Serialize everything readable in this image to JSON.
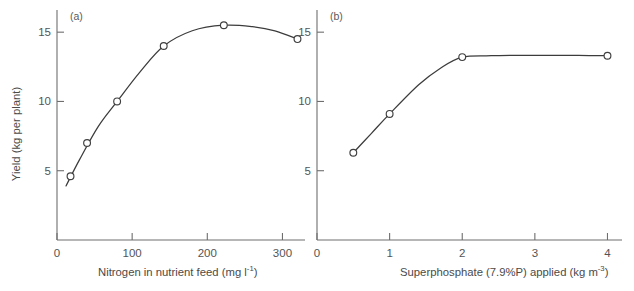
{
  "figure": {
    "ylabel": "Yield (kg per plant)",
    "caption_partial": ""
  },
  "chart_data": [
    {
      "type": "scatter",
      "panel_label": "(a)",
      "title": "",
      "xlabel": "Nitrogen in nutrient feed (mg l",
      "xlabel_sup": "-1",
      "xlabel_tail": ")",
      "ylabel": "Yield (kg per plant)",
      "xlim": [
        0,
        330
      ],
      "ylim": [
        0,
        16.6
      ],
      "xticks": [
        0,
        100,
        200,
        300
      ],
      "xticklabels": [
        "0",
        "100",
        "200",
        "300"
      ],
      "yticks": [
        5,
        10,
        15
      ],
      "yticklabels": [
        "5",
        "10",
        "15"
      ],
      "grid": false,
      "legend": "none",
      "marker": "open-circle",
      "x": [
        18,
        40,
        80,
        142,
        222,
        320
      ],
      "y": [
        4.6,
        7.0,
        10.0,
        14.0,
        15.5,
        14.5
      ],
      "fit_curve": {
        "description": "smooth fitted curve rising to a maximum near 230 mg/l then declining",
        "x": [
          12,
          30,
          55,
          80,
          110,
          142,
          180,
          222,
          260,
          290,
          320
        ],
        "y": [
          3.9,
          5.8,
          8.2,
          10.0,
          12.1,
          14.0,
          15.1,
          15.5,
          15.4,
          15.1,
          14.5
        ]
      }
    },
    {
      "type": "scatter",
      "panel_label": "(b)",
      "title": "",
      "xlabel": "Superphosphate (7.9%P) applied (kg m",
      "xlabel_sup": "-3",
      "xlabel_tail": ")",
      "ylabel": "Yield (kg per plant)",
      "xlim": [
        0,
        4.2
      ],
      "ylim": [
        0,
        16.6
      ],
      "xticks": [
        0,
        1,
        2,
        3,
        4
      ],
      "xticklabels": [
        "0",
        "1",
        "2",
        "3",
        "4"
      ],
      "yticks": [
        5,
        10,
        15
      ],
      "yticklabels": [
        "5",
        "10",
        "15"
      ],
      "grid": false,
      "legend": "none",
      "marker": "open-circle",
      "x": [
        0.5,
        1.0,
        2.0,
        4.0
      ],
      "y": [
        6.3,
        9.1,
        13.2,
        13.3
      ],
      "fit_curve": {
        "description": "smooth saturating curve reaching a plateau near 13.3 kg per plant above 2 kg/m3",
        "x": [
          0.5,
          0.75,
          1.0,
          1.4,
          1.7,
          2.0,
          2.4,
          2.8,
          3.2,
          3.6,
          4.0
        ],
        "y": [
          6.3,
          7.7,
          9.1,
          11.2,
          12.4,
          13.2,
          13.3,
          13.33,
          13.33,
          13.32,
          13.3
        ]
      }
    }
  ]
}
